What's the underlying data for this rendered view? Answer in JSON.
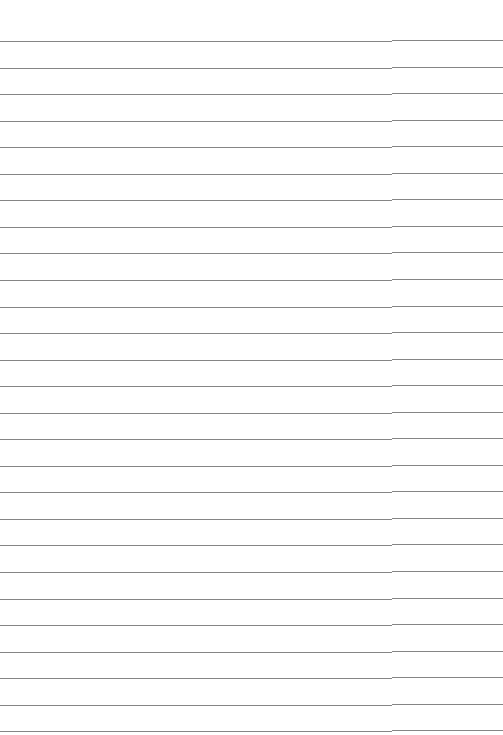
{
  "page": {
    "type": "blank-lined-paper",
    "background_color": "#ffffff",
    "line_color": "#858585",
    "line_count": 27,
    "first_line_y": 41,
    "line_spacing": 26.55,
    "lines": []
  }
}
